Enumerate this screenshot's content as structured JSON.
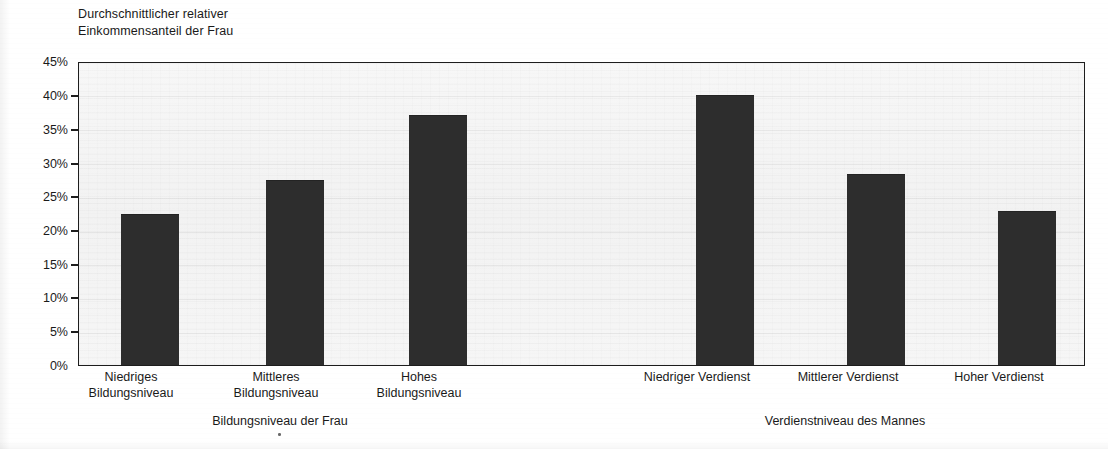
{
  "chart_data": {
    "type": "bar",
    "title": "",
    "ylabel_lines": [
      "Durchschnittlicher relativer",
      "Einkommensanteil der Frau"
    ],
    "ylabel": "Durchschnittlicher relativer Einkommensanteil der Frau",
    "xlabel": "",
    "ylim": [
      0,
      45
    ],
    "ytick_labels": [
      "45%",
      "40%",
      "35%",
      "30%",
      "25%",
      "20%",
      "15%",
      "10%",
      "5%",
      "0%"
    ],
    "ytick_values": [
      45,
      40,
      35,
      30,
      25,
      20,
      15,
      10,
      5,
      0
    ],
    "grid": true,
    "legend": "none",
    "bar_color": "#2d2d2d",
    "plot_background": "#f4f4f4",
    "axis_color": "#1d1d1d",
    "categories": [
      "Niedriges Bildungsniveau",
      "Mittleres Bildungsniveau",
      "Hohes Bildungsniveau",
      "Niedriger Verdienst",
      "Mittlerer Verdienst",
      "Hoher Verdienst"
    ],
    "values": [
      22.5,
      27.5,
      37.3,
      40.3,
      28.4,
      23.0
    ],
    "groups": [
      {
        "title": "Bildungsniveau der Frau",
        "categories": [
          {
            "lines": [
              "Niedriges",
              "Bildungsniveau"
            ],
            "value": 22.5
          },
          {
            "lines": [
              "Mittleres",
              "Bildungsniveau"
            ],
            "value": 27.5
          },
          {
            "lines": [
              "Hohes",
              "Bildungsniveau"
            ],
            "value": 37.3
          }
        ]
      },
      {
        "title": "Verdienstniveau des Mannes",
        "categories": [
          {
            "lines": [
              "Niedriger Verdienst"
            ],
            "value": 40.3
          },
          {
            "lines": [
              "Mittlerer Verdienst"
            ],
            "value": 28.4
          },
          {
            "lines": [
              "Hoher Verdienst"
            ],
            "value": 23.0
          }
        ]
      }
    ]
  }
}
